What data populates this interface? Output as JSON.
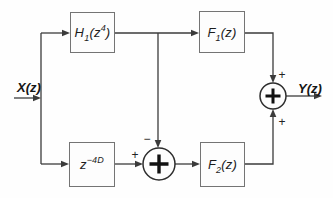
{
  "diagram": {
    "input": {
      "label": "X(z)"
    },
    "output": {
      "label": "Y(z)"
    },
    "blocks": {
      "h1": {
        "pre": "H",
        "sub": "1",
        "mid": "(z",
        "sup": "4",
        "post": ")"
      },
      "delay": {
        "pre": "z",
        "sub": "",
        "mid": "",
        "sup": "−4D",
        "post": ""
      },
      "f1": {
        "pre": "F",
        "sub": "1",
        "mid": "(z)",
        "sup": "",
        "post": ""
      },
      "f2": {
        "pre": "F",
        "sub": "2",
        "mid": "(z)",
        "sup": "",
        "post": ""
      }
    },
    "junctions": {
      "subtractor": {
        "top_sign": "−",
        "left_sign": "+"
      },
      "adder": {
        "top_sign": "+",
        "bottom_sign": "+"
      }
    },
    "colors": {
      "wire": "#3b3b3b",
      "circle": "#2d2d2d",
      "block_border": "#747474"
    }
  }
}
